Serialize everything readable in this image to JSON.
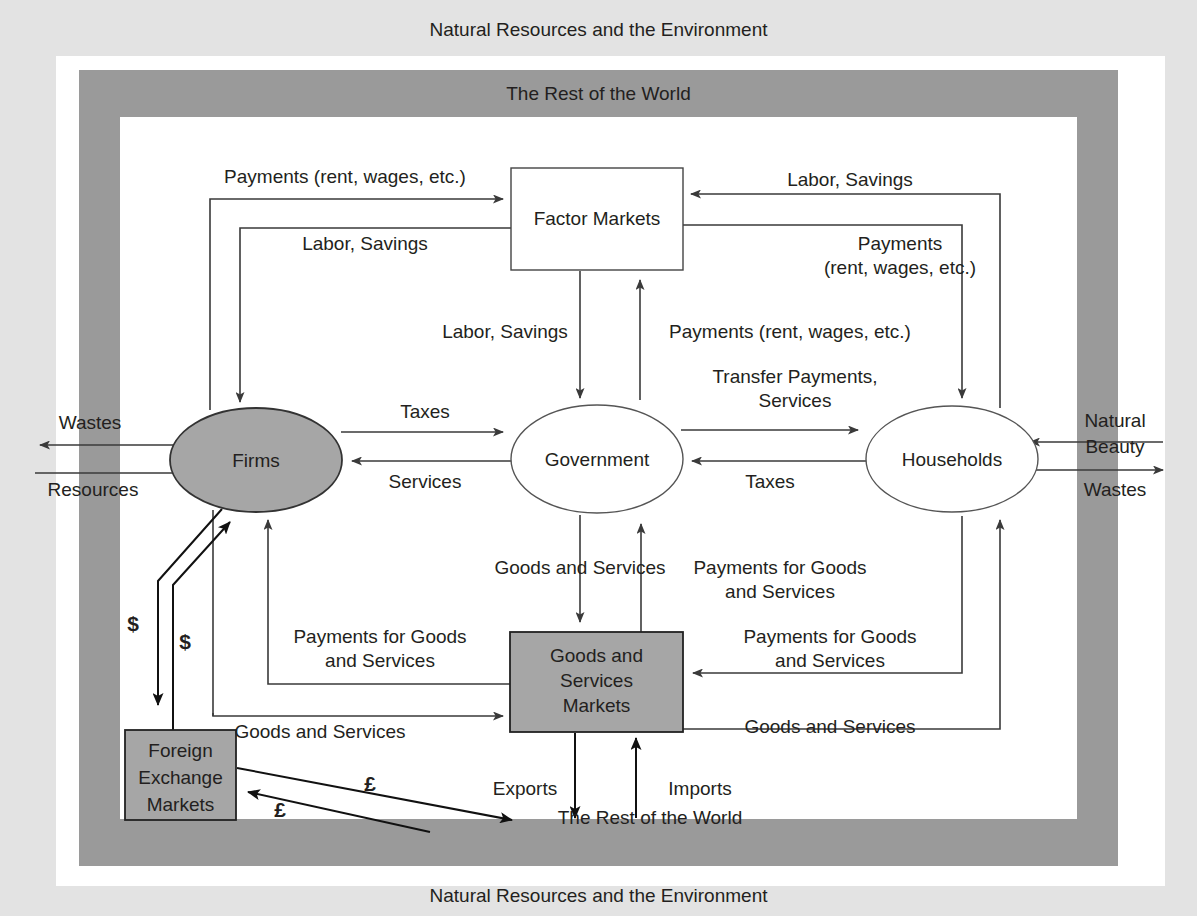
{
  "frame": {
    "outer_band_top_label": "Natural Resources and the Environment",
    "outer_band_bottom_label": "Natural Resources and the Environment",
    "inner_band_top_label": "The Rest of the World",
    "inner_band_bottom_label": "The Rest of the World",
    "outer_band_color": "#e3e3e3",
    "inner_band_color": "#9a9a9a",
    "page_background": "#ffffff"
  },
  "nodes": {
    "firms": {
      "label": "Firms",
      "shape": "ellipse",
      "fill": "#a6a6a6"
    },
    "government": {
      "label": "Government",
      "shape": "ellipse",
      "fill": "#ffffff"
    },
    "households": {
      "label": "Households",
      "shape": "ellipse",
      "fill": "#ffffff"
    },
    "factor_markets": {
      "label": "Factor Markets",
      "shape": "rect",
      "fill": "#ffffff"
    },
    "goods_services_markets": {
      "label_line1": "Goods and",
      "label_line2": "Services",
      "label_line3": "Markets",
      "shape": "rect",
      "fill": "#a6a6a6"
    },
    "foreign_exchange_markets": {
      "label_line1": "Foreign",
      "label_line2": "Exchange",
      "label_line3": "Markets",
      "shape": "rect",
      "fill": "#a6a6a6"
    }
  },
  "flows": {
    "payments_rent_wages_top_left": "Payments (rent, wages, etc.)",
    "labor_savings_top_left": "Labor, Savings",
    "labor_savings_top_right": "Labor, Savings",
    "payments_top_right_line1": "Payments",
    "payments_top_right_line2": "(rent, wages, etc.)",
    "labor_savings_center_left": "Labor, Savings",
    "payments_rent_wages_center_right": "Payments (rent, wages, etc.)",
    "transfer_payments_line1": "Transfer Payments,",
    "transfer_payments_line2": "Services",
    "taxes_firms_to_government": "Taxes",
    "services_government_to_firms": "Services",
    "taxes_households_to_government": "Taxes",
    "goods_and_services_gov_down": "Goods and Services",
    "payments_for_goods_right_line1": "Payments for Goods",
    "payments_for_goods_right_line2": "and Services",
    "payments_for_goods_left_line1": "Payments for Goods",
    "payments_for_goods_left_line2": "and Services",
    "payments_for_goods_households_line1": "Payments for Goods",
    "payments_for_goods_households_line2": "and Services",
    "goods_and_services_firms_to_market": "Goods and Services",
    "goods_and_services_market_to_households": "Goods and Services",
    "wastes_left": "Wastes",
    "resources_left": "Resources",
    "natural_beauty_right_line1": "Natural",
    "natural_beauty_right_line2": "Beauty",
    "wastes_right": "Wastes",
    "dollar_out": "$",
    "dollar_in": "$",
    "pound_out": "£",
    "pound_in": "£",
    "exports": "Exports",
    "imports": "Imports"
  }
}
